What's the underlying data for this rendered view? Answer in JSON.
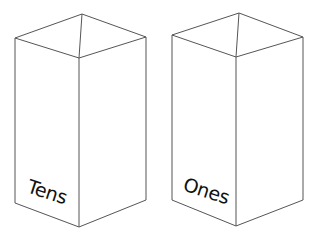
{
  "scene": {
    "title": "Place value boxes",
    "background_color": "#ffffff",
    "line_color": "#555555",
    "label_color": "#111111",
    "width": 320,
    "height": 240
  },
  "boxes": [
    {
      "id": "tens-box",
      "label": "Tens",
      "label_rotation_degrees": 18,
      "label_x": 26,
      "label_y": 192,
      "geometry": {
        "top_back": [
          82,
          14
        ],
        "top_left": [
          15,
          38
        ],
        "top_right": [
          146,
          37
        ],
        "top_front": [
          79,
          58
        ],
        "bottom_left": [
          15,
          203
        ],
        "bottom_right": [
          146,
          200
        ],
        "bottom_front": [
          79,
          227
        ]
      }
    },
    {
      "id": "ones-box",
      "label": "Ones",
      "label_rotation_degrees": 18,
      "label_x": 182,
      "label_y": 190,
      "geometry": {
        "top_back": [
          239,
          13
        ],
        "top_left": [
          172,
          35
        ],
        "top_right": [
          303,
          37
        ],
        "top_front": [
          236,
          57
        ],
        "bottom_left": [
          172,
          200
        ],
        "bottom_right": [
          303,
          200
        ],
        "bottom_front": [
          236,
          226
        ]
      }
    }
  ]
}
